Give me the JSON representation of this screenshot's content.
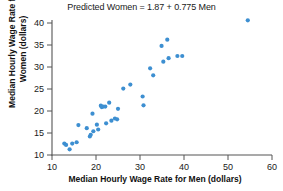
{
  "chart_data": {
    "type": "scatter",
    "title": "Predicted Women = 1.87 + 0.775 Men",
    "xlabel": "Median Hourly Wage Rate for Men (dollars)",
    "ylabel_line1": "Median Hourly Wage Rate for",
    "ylabel_line2": "Women (dollars)",
    "xlim": [
      10,
      60
    ],
    "ylim": [
      10,
      41
    ],
    "xticks": [
      10,
      20,
      30,
      40,
      50,
      60
    ],
    "yticks": [
      10,
      15,
      20,
      25,
      30,
      35,
      40
    ],
    "grid": false,
    "legend": "none",
    "marker_color": "#3d8fd1",
    "axis_color": "#555555",
    "regression": {
      "intercept": 1.87,
      "slope": 0.775,
      "equation": "Predicted Women = 1.87 + 0.775 Men",
      "drawn": false
    },
    "points": [
      [
        12.8,
        12.6
      ],
      [
        13.2,
        12.3
      ],
      [
        14.0,
        11.3
      ],
      [
        14.6,
        12.6
      ],
      [
        15.6,
        12.9
      ],
      [
        16.0,
        16.8
      ],
      [
        17.9,
        16.1
      ],
      [
        18.6,
        14.2
      ],
      [
        18.8,
        14.6
      ],
      [
        19.2,
        19.4
      ],
      [
        19.4,
        15.4
      ],
      [
        20.2,
        16.9
      ],
      [
        20.5,
        15.8
      ],
      [
        21.1,
        21.2
      ],
      [
        21.3,
        20.9
      ],
      [
        21.6,
        21.0
      ],
      [
        22.1,
        21.0
      ],
      [
        22.3,
        17.2
      ],
      [
        23.0,
        21.9
      ],
      [
        23.5,
        17.8
      ],
      [
        24.3,
        18.3
      ],
      [
        24.8,
        18.1
      ],
      [
        25.0,
        20.5
      ],
      [
        26.2,
        25.1
      ],
      [
        27.8,
        26.0
      ],
      [
        30.6,
        23.3
      ],
      [
        30.8,
        21.3
      ],
      [
        32.3,
        29.7
      ],
      [
        33.0,
        28.1
      ],
      [
        34.9,
        34.8
      ],
      [
        35.3,
        31.2
      ],
      [
        36.2,
        36.2
      ],
      [
        36.5,
        32.0
      ],
      [
        38.5,
        32.5
      ],
      [
        39.6,
        32.5
      ],
      [
        54.5,
        40.6
      ]
    ]
  }
}
